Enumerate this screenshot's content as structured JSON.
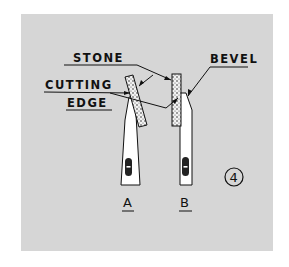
{
  "figure": {
    "number": "4",
    "labels": {
      "stone": "STONE",
      "bevel": "BEVEL",
      "cutting": "CUTTING",
      "edge": "EDGE"
    },
    "views": [
      {
        "id": "A",
        "label": "A"
      },
      {
        "id": "B",
        "label": "B"
      }
    ],
    "colors": {
      "background": "#d6d6d6",
      "line": "#111111",
      "blade": "#ffffff"
    }
  }
}
